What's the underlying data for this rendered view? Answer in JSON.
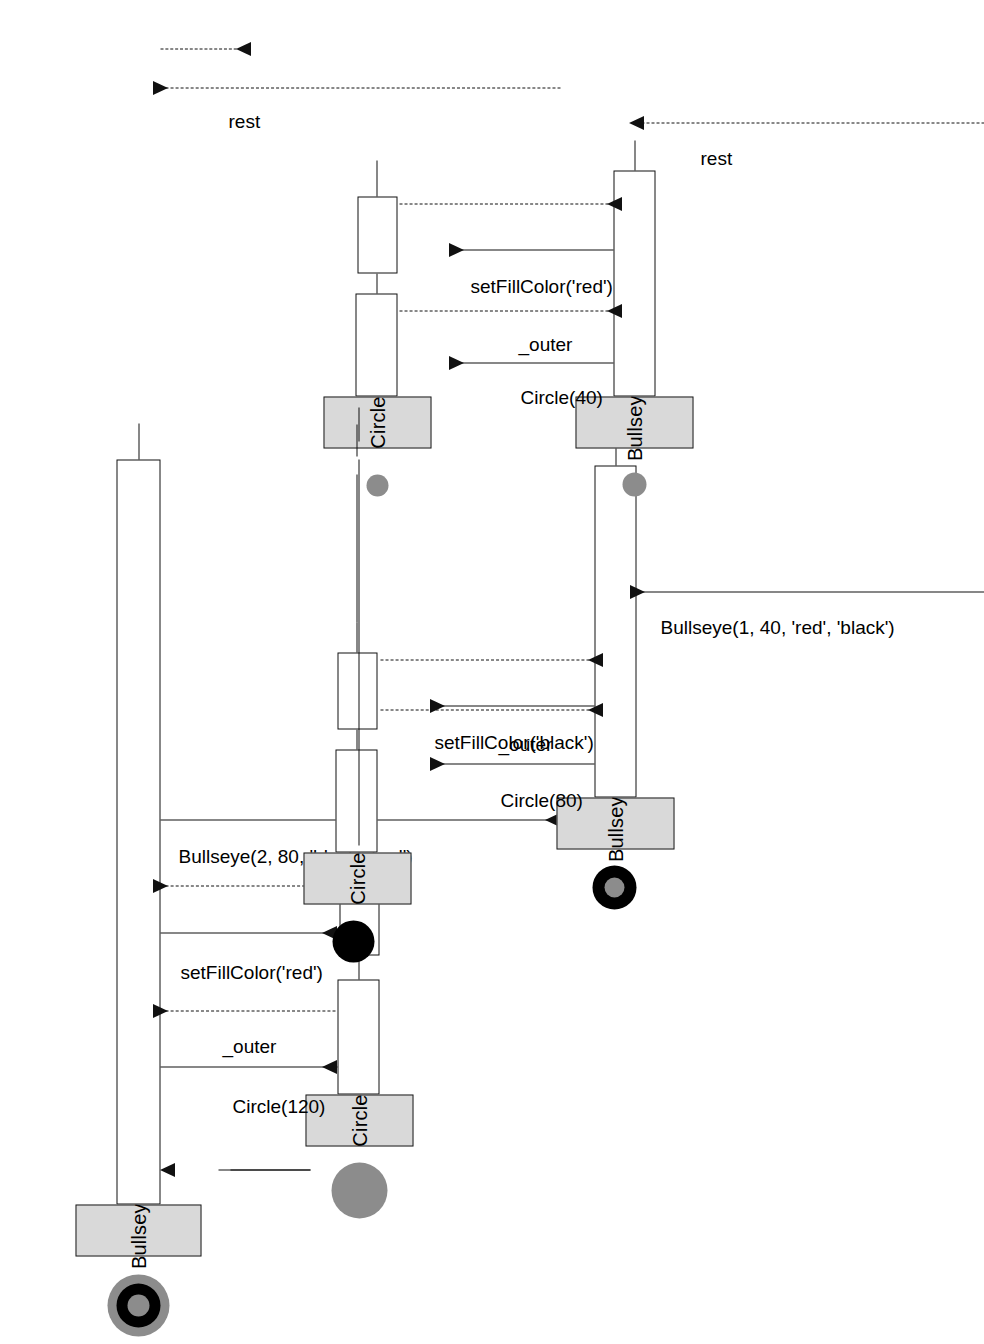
{
  "diagram": {
    "type": "uml-sequence-diagram",
    "orientation": "rotated-90-ccw",
    "background": "#ffffff",
    "line_color": "#111111",
    "head_fill": "#d9d9d9"
  },
  "participants": [
    {
      "id": "bullseye1",
      "label": "Bullseye",
      "icon": "bullseye-3ring-icon",
      "icon_colors": [
        "#8c8c8c",
        "#000000",
        "#8c8c8c"
      ],
      "icon_size": 62
    },
    {
      "id": "circle1",
      "label": "Circle",
      "icon": "circle-gray-icon",
      "icon_colors": [
        "#8c8c8c"
      ],
      "icon_size": 56
    },
    {
      "id": "bullseye2",
      "label": "Bullseye",
      "icon": "bullseye-2ring-icon",
      "icon_colors": [
        "#000000",
        "#8c8c8c"
      ],
      "icon_size": 44
    },
    {
      "id": "circle2",
      "label": "Circle",
      "icon": "circle-black-icon",
      "icon_colors": [
        "#000000"
      ],
      "icon_size": 42
    },
    {
      "id": "bullseye3",
      "label": "Bullseye",
      "icon": "circle-gray-small-icon",
      "icon_colors": [
        "#8c8c8c"
      ],
      "icon_size": 24
    },
    {
      "id": "circle3",
      "label": "Circle",
      "icon": "circle-gray-small-icon",
      "icon_colors": [
        "#8c8c8c"
      ],
      "icon_size": 22
    }
  ],
  "messages": [
    {
      "id": "m-start",
      "label": "",
      "kind": "found",
      "from": "external",
      "to": "bullseye1"
    },
    {
      "id": "m1",
      "label": "Circle(120)",
      "kind": "call",
      "from": "bullseye1",
      "to": "circle1"
    },
    {
      "id": "r1",
      "label": "_outer",
      "kind": "return",
      "from": "circle1",
      "to": "bullseye1"
    },
    {
      "id": "m2",
      "label": "setFillColor('red')",
      "kind": "call",
      "from": "bullseye1",
      "to": "circle1",
      "label_plain": "setFillColor(",
      "label_mono": "'red'",
      "label_tail": ")"
    },
    {
      "id": "r2",
      "label": "",
      "kind": "return",
      "from": "circle1",
      "to": "bullseye1"
    },
    {
      "id": "m3",
      "label": "Bullseye(2, 80, 'black', 'red')",
      "kind": "call",
      "from": "bullseye1",
      "to": "bullseye2",
      "label_plain": "Bullseye(2, 80, ",
      "label_mono": "'black', 'red'",
      "label_tail": ")"
    },
    {
      "id": "m4",
      "label": "Circle(80)",
      "kind": "call",
      "from": "bullseye2",
      "to": "circle2"
    },
    {
      "id": "r4",
      "label": "_outer",
      "kind": "return",
      "from": "circle2",
      "to": "bullseye2"
    },
    {
      "id": "m5",
      "label": "setFillColor('black')",
      "kind": "call",
      "from": "bullseye2",
      "to": "circle2",
      "label_plain": "setFillColor(",
      "label_mono": "'black'",
      "label_tail": ")"
    },
    {
      "id": "r5",
      "label": "",
      "kind": "return",
      "from": "circle2",
      "to": "bullseye2"
    },
    {
      "id": "m6",
      "label": "Bullseye(1, 40, 'red', 'black')",
      "kind": "call",
      "from": "bullseye2",
      "to": "bullseye3",
      "label_plain": "Bullseye(1, 40, ",
      "label_mono": "'red', 'black'",
      "label_tail": ")"
    },
    {
      "id": "m7",
      "label": "Circle(40)",
      "kind": "call",
      "from": "bullseye3",
      "to": "circle3"
    },
    {
      "id": "r7",
      "label": "_outer",
      "kind": "return",
      "from": "circle3",
      "to": "bullseye3"
    },
    {
      "id": "m8",
      "label": "setFillColor('red')",
      "kind": "call",
      "from": "bullseye3",
      "to": "circle3",
      "label_plain": "setFillColor(",
      "label_mono": "'red'",
      "label_tail": ")"
    },
    {
      "id": "r8",
      "label": "",
      "kind": "return",
      "from": "circle3",
      "to": "bullseye3"
    },
    {
      "id": "rest2",
      "label": "rest",
      "kind": "return",
      "from": "bullseye3",
      "to": "bullseye2"
    },
    {
      "id": "rest1",
      "label": "rest",
      "kind": "return",
      "from": "bullseye2",
      "to": "bullseye1"
    },
    {
      "id": "rest0",
      "label": "",
      "kind": "return",
      "from": "bullseye1",
      "to": "external"
    }
  ],
  "labels": {
    "circle120": "Circle(120)",
    "circle80": "Circle(80)",
    "circle40": "Circle(40)",
    "outer": "_outer",
    "rest": "rest",
    "setfill_head": "setFillColor(",
    "setfill_tail": ")",
    "red_literal": "'red'",
    "black_literal": "'black'",
    "bullseye2_head": "Bullseye(2, 80, ",
    "bullseye2_mono": "'black', 'red'",
    "bullseye2_tail": ")",
    "bullseye1_head": "Bullseye(1, 40, ",
    "bullseye1_mono": "'red', 'black'",
    "bullseye1_tail": ")"
  }
}
